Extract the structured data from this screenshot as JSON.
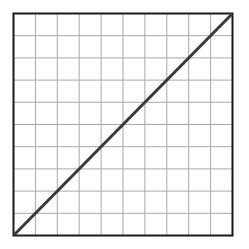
{
  "diagram": {
    "type": "grid-with-diagonal",
    "grid": {
      "columns": 10,
      "rows": 10,
      "line_color": "#a8a8a8",
      "border_color": "#1a1a1a"
    },
    "diagonal": {
      "from": "bottom-left",
      "to": "top-right",
      "color": "#3a3a3a"
    },
    "background": "#ffffff"
  }
}
